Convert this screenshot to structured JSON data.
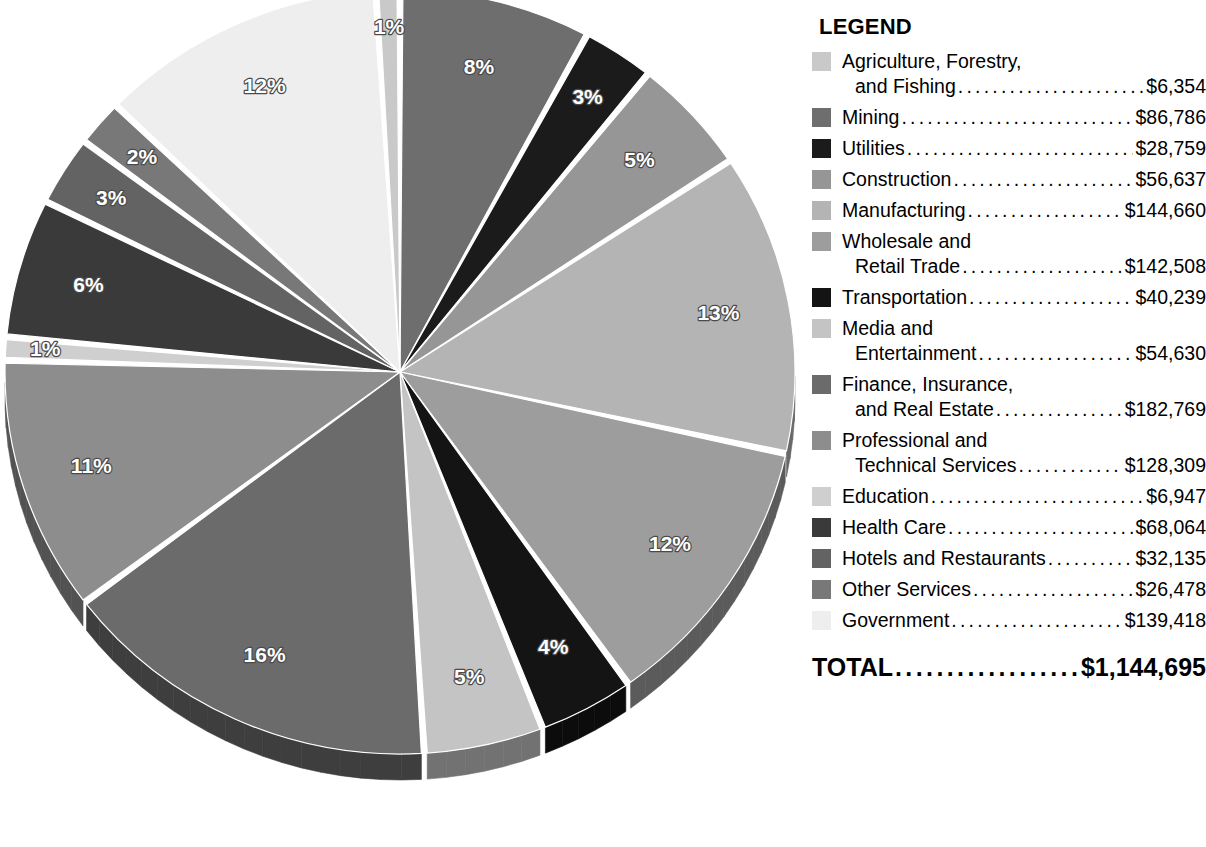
{
  "legend": {
    "title": "LEGEND",
    "total_label": "TOTAL",
    "total_value": "$1,144,695",
    "items": [
      {
        "name_line1": "Agriculture, Forestry,",
        "name_line2": "and Fishing",
        "value": "$6,354",
        "color": "#c9c9c9",
        "percent": "1%",
        "amount": 6354
      },
      {
        "name_line1": "Mining",
        "name_line2": "",
        "value": "$86,786",
        "color": "#6e6e6e",
        "percent": "8%",
        "amount": 86786
      },
      {
        "name_line1": "Utilities",
        "name_line2": "",
        "value": "$28,759",
        "color": "#1b1b1b",
        "percent": "3%",
        "amount": 28759
      },
      {
        "name_line1": "Construction",
        "name_line2": "",
        "value": "$56,637",
        "color": "#969696",
        "percent": "5%",
        "amount": 56637
      },
      {
        "name_line1": "Manufacturing",
        "name_line2": "",
        "value": "$144,660",
        "color": "#b4b4b4",
        "percent": "13%",
        "amount": 144660
      },
      {
        "name_line1": "Wholesale and",
        "name_line2": "Retail Trade",
        "value": "$142,508",
        "color": "#9d9d9d",
        "percent": "12%",
        "amount": 142508
      },
      {
        "name_line1": "Transportation",
        "name_line2": "",
        "value": "$40,239",
        "color": "#141414",
        "percent": "4%",
        "amount": 40239
      },
      {
        "name_line1": "Media and",
        "name_line2": "Entertainment",
        "value": "$54,630",
        "color": "#c4c4c4",
        "percent": "5%",
        "amount": 54630
      },
      {
        "name_line1": "Finance, Insurance,",
        "name_line2": "and Real Estate",
        "value": "$182,769",
        "color": "#6b6b6b",
        "percent": "16%",
        "amount": 182769
      },
      {
        "name_line1": "Professional and",
        "name_line2": "Technical Services",
        "value": "$128,309",
        "color": "#8d8d8d",
        "percent": "11%",
        "amount": 128309
      },
      {
        "name_line1": "Education",
        "name_line2": "",
        "value": "$6,947",
        "color": "#cfcfcf",
        "percent": "1%",
        "amount": 6947
      },
      {
        "name_line1": "Health Care",
        "name_line2": "",
        "value": "$68,064",
        "color": "#3a3a3a",
        "percent": "6%",
        "amount": 68064
      },
      {
        "name_line1": "Hotels and Restaurants",
        "name_line2": "",
        "value": "$32,135",
        "color": "#636363",
        "percent": "3%",
        "amount": 32135
      },
      {
        "name_line1": "Other Services",
        "name_line2": "",
        "value": "$26,478",
        "color": "#787878",
        "percent": "2%",
        "amount": 26478
      },
      {
        "name_line1": "Government",
        "name_line2": "",
        "value": "$139,418",
        "color": "#eeeeee",
        "percent": "12%",
        "amount": 139418
      }
    ]
  },
  "chart_data": {
    "type": "pie",
    "title": "",
    "unit": "millions of dollars",
    "total": 1144695,
    "total_label": "$1,144,695",
    "legend_position": "right",
    "start_angle_deg": -90,
    "direction": "clockwise",
    "labels_shown": "percent",
    "slice_order_clockwise_from_top": [
      "Mining",
      "Utilities",
      "Construction",
      "Manufacturing",
      "Wholesale and Retail Trade",
      "Transportation",
      "Media and Entertainment",
      "Finance, Insurance, and Real Estate",
      "Professional and Technical Services",
      "Education",
      "Health Care",
      "Hotels and Restaurants",
      "Other Services",
      "Government",
      "Agriculture, Forestry, and Fishing"
    ],
    "slices": [
      {
        "label": "Mining",
        "value": 86786,
        "percent": 8,
        "percent_label": "8%",
        "color": "#6e6e6e"
      },
      {
        "label": "Utilities",
        "value": 28759,
        "percent": 3,
        "percent_label": "3%",
        "color": "#1b1b1b"
      },
      {
        "label": "Construction",
        "value": 56637,
        "percent": 5,
        "percent_label": "5%",
        "color": "#969696"
      },
      {
        "label": "Manufacturing",
        "value": 144660,
        "percent": 13,
        "percent_label": "13%",
        "color": "#b4b4b4"
      },
      {
        "label": "Wholesale and Retail Trade",
        "value": 142508,
        "percent": 12,
        "percent_label": "12%",
        "color": "#9d9d9d"
      },
      {
        "label": "Transportation",
        "value": 40239,
        "percent": 4,
        "percent_label": "4%",
        "color": "#141414"
      },
      {
        "label": "Media and Entertainment",
        "value": 54630,
        "percent": 5,
        "percent_label": "5%",
        "color": "#c4c4c4"
      },
      {
        "label": "Finance, Insurance, and Real Estate",
        "value": 182769,
        "percent": 16,
        "percent_label": "16%",
        "color": "#6b6b6b"
      },
      {
        "label": "Professional and Technical Services",
        "value": 128309,
        "percent": 11,
        "percent_label": "11%",
        "color": "#8d8d8d"
      },
      {
        "label": "Education",
        "value": 6947,
        "percent": 1,
        "percent_label": "1%",
        "color": "#cfcfcf"
      },
      {
        "label": "Health Care",
        "value": 68064,
        "percent": 6,
        "percent_label": "6%",
        "color": "#3a3a3a"
      },
      {
        "label": "Hotels and Restaurants",
        "value": 32135,
        "percent": 3,
        "percent_label": "3%",
        "color": "#636363"
      },
      {
        "label": "Other Services",
        "value": 26478,
        "percent": 2,
        "percent_label": "2%",
        "color": "#787878"
      },
      {
        "label": "Government",
        "value": 139418,
        "percent": 12,
        "percent_label": "12%",
        "color": "#eeeeee"
      },
      {
        "label": "Agriculture, Forestry, and Fishing",
        "value": 6354,
        "percent": 1,
        "percent_label": "1%",
        "color": "#c9c9c9"
      }
    ]
  },
  "geometry": {
    "cx": 400,
    "cy": 372,
    "rx": 395,
    "ry": 382,
    "depth": 26,
    "label_radius_frac": 0.82
  }
}
